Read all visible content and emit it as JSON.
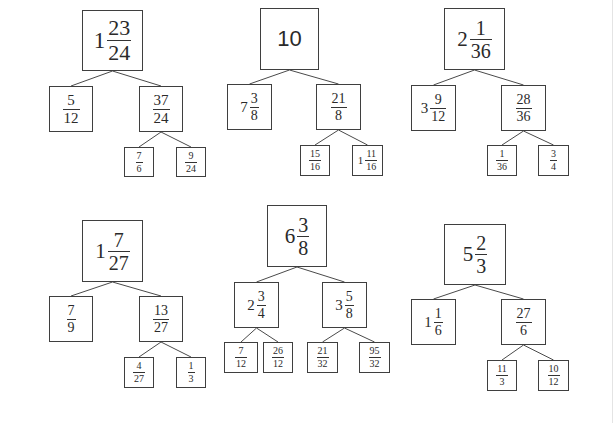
{
  "diagram": {
    "type": "fraction-decomposition-trees",
    "colors": {
      "background": "#ffffff",
      "border": "#3f3f3f",
      "text": "#2a2a2a",
      "edge": "#4a4a4a"
    },
    "trees": [
      {
        "id": "tree-1",
        "nodes": [
          {
            "id": "t1-root",
            "label": "1 23/24",
            "whole": "1",
            "num": "23",
            "den": "24",
            "box": [
              82,
              10,
              61,
              61
            ],
            "size": 22
          },
          {
            "id": "t1-left",
            "label": "5/12",
            "whole": "",
            "num": "5",
            "den": "12",
            "box": [
              49,
              86,
              44,
              46
            ],
            "size": 15
          },
          {
            "id": "t1-right",
            "label": "37/24",
            "whole": "",
            "num": "37",
            "den": "24",
            "box": [
              139,
              86,
              44,
              46
            ],
            "size": 15
          },
          {
            "id": "t1-rl",
            "label": "7/6",
            "whole": "",
            "num": "7",
            "den": "6",
            "box": [
              124,
              147,
              30,
              30
            ],
            "size": 10
          },
          {
            "id": "t1-rr",
            "label": "9/24",
            "whole": "",
            "num": "9",
            "den": "24",
            "box": [
              176,
              147,
              30,
              30
            ],
            "size": 10
          }
        ],
        "edges": [
          [
            "t1-root",
            "t1-left"
          ],
          [
            "t1-root",
            "t1-right"
          ],
          [
            "t1-right",
            "t1-rl"
          ],
          [
            "t1-right",
            "t1-rr"
          ]
        ]
      },
      {
        "id": "tree-2",
        "nodes": [
          {
            "id": "t2-root",
            "label": "10",
            "whole": "10",
            "num": "",
            "den": "",
            "box": [
              260,
              8,
              59,
              62
            ],
            "size": 22
          },
          {
            "id": "t2-left",
            "label": "7 3/8",
            "whole": "7",
            "num": "3",
            "den": "8",
            "box": [
              227,
              84,
              45,
              46
            ],
            "size": 14
          },
          {
            "id": "t2-right",
            "label": "21/8",
            "whole": "",
            "num": "21",
            "den": "8",
            "box": [
              316,
              84,
              45,
              46
            ],
            "size": 14
          },
          {
            "id": "t2-rl",
            "label": "15/16",
            "whole": "",
            "num": "15",
            "den": "16",
            "box": [
              300,
              145,
              30,
              31
            ],
            "size": 10
          },
          {
            "id": "t2-rr",
            "label": "1 11/16",
            "whole": "1",
            "num": "11",
            "den": "16",
            "box": [
              352,
              145,
              31,
              31
            ],
            "size": 10
          }
        ],
        "edges": [
          [
            "t2-root",
            "t2-left"
          ],
          [
            "t2-root",
            "t2-right"
          ],
          [
            "t2-right",
            "t2-rl"
          ],
          [
            "t2-right",
            "t2-rr"
          ]
        ]
      },
      {
        "id": "tree-3",
        "nodes": [
          {
            "id": "t3-root",
            "label": "2 1/36",
            "whole": "2",
            "num": "1",
            "den": "36",
            "box": [
              444,
              8,
              61,
              62
            ],
            "size": 20
          },
          {
            "id": "t3-left",
            "label": "3 9/12",
            "whole": "3",
            "num": "9",
            "den": "12",
            "box": [
              411,
              85,
              45,
              46
            ],
            "size": 14
          },
          {
            "id": "t3-right",
            "label": "28/36",
            "whole": "",
            "num": "28",
            "den": "36",
            "box": [
              501,
              85,
              45,
              46
            ],
            "size": 14
          },
          {
            "id": "t3-rl",
            "label": "1/36",
            "whole": "",
            "num": "1",
            "den": "36",
            "box": [
              487,
              145,
              30,
              31
            ],
            "size": 10
          },
          {
            "id": "t3-rr",
            "label": "3/4",
            "whole": "",
            "num": "3",
            "den": "4",
            "box": [
              538,
              145,
              31,
              31
            ],
            "size": 10
          }
        ],
        "edges": [
          [
            "t3-root",
            "t3-left"
          ],
          [
            "t3-root",
            "t3-right"
          ],
          [
            "t3-right",
            "t3-rl"
          ],
          [
            "t3-right",
            "t3-rr"
          ]
        ]
      },
      {
        "id": "tree-4",
        "nodes": [
          {
            "id": "t4-root",
            "label": "1 7/27",
            "whole": "1",
            "num": "7",
            "den": "27",
            "box": [
              82,
              220,
              61,
              62
            ],
            "size": 20
          },
          {
            "id": "t4-left",
            "label": "7/9",
            "whole": "",
            "num": "7",
            "den": "9",
            "box": [
              49,
              296,
              44,
              46
            ],
            "size": 14
          },
          {
            "id": "t4-right",
            "label": "13/27",
            "whole": "",
            "num": "13",
            "den": "27",
            "box": [
              139,
              296,
              44,
              46
            ],
            "size": 14
          },
          {
            "id": "t4-rl",
            "label": "4/27",
            "whole": "",
            "num": "4",
            "den": "27",
            "box": [
              124,
              357,
              30,
              31
            ],
            "size": 10
          },
          {
            "id": "t4-rr",
            "label": "1/3",
            "whole": "",
            "num": "1",
            "den": "3",
            "box": [
              176,
              357,
              30,
              31
            ],
            "size": 10
          }
        ],
        "edges": [
          [
            "t4-root",
            "t4-left"
          ],
          [
            "t4-root",
            "t4-right"
          ],
          [
            "t4-right",
            "t4-rl"
          ],
          [
            "t4-right",
            "t4-rr"
          ]
        ]
      },
      {
        "id": "tree-5",
        "nodes": [
          {
            "id": "t5-root",
            "label": "6 3/8",
            "whole": "6",
            "num": "3",
            "den": "8",
            "box": [
              267,
              205,
              60,
              62
            ],
            "size": 20
          },
          {
            "id": "t5-left",
            "label": "2 3/4",
            "whole": "2",
            "num": "3",
            "den": "4",
            "box": [
              234,
              282,
              45,
              46
            ],
            "size": 14
          },
          {
            "id": "t5-right",
            "label": "3 5/8",
            "whole": "3",
            "num": "5",
            "den": "8",
            "box": [
              322,
              282,
              45,
              46
            ],
            "size": 14
          },
          {
            "id": "t5-ll",
            "label": "7/12",
            "whole": "",
            "num": "7",
            "den": "12",
            "box": [
              224,
              342,
              34,
              31
            ],
            "size": 10
          },
          {
            "id": "t5-lr",
            "label": "26/12",
            "whole": "",
            "num": "26",
            "den": "12",
            "box": [
              263,
              342,
              30,
              31
            ],
            "size": 10
          },
          {
            "id": "t5-rl",
            "label": "21/32",
            "whole": "",
            "num": "21",
            "den": "32",
            "box": [
              307,
              342,
              31,
              31
            ],
            "size": 10
          },
          {
            "id": "t5-rr",
            "label": "95/32",
            "whole": "",
            "num": "95",
            "den": "32",
            "box": [
              359,
              342,
              31,
              31
            ],
            "size": 10
          }
        ],
        "edges": [
          [
            "t5-root",
            "t5-left"
          ],
          [
            "t5-root",
            "t5-right"
          ],
          [
            "t5-left",
            "t5-ll"
          ],
          [
            "t5-left",
            "t5-lr"
          ],
          [
            "t5-right",
            "t5-rl"
          ],
          [
            "t5-right",
            "t5-rr"
          ]
        ]
      },
      {
        "id": "tree-6",
        "nodes": [
          {
            "id": "t6-root",
            "label": "5 2/3",
            "whole": "5",
            "num": "2",
            "den": "3",
            "box": [
              444,
              224,
              62,
              61
            ],
            "size": 20
          },
          {
            "id": "t6-left",
            "label": "1 1/6",
            "whole": "1",
            "num": "1",
            "den": "6",
            "box": [
              411,
              299,
              45,
              46
            ],
            "size": 14
          },
          {
            "id": "t6-right",
            "label": "27/6",
            "whole": "",
            "num": "27",
            "den": "6",
            "box": [
              501,
              299,
              45,
              46
            ],
            "size": 14
          },
          {
            "id": "t6-rl",
            "label": "11/3",
            "whole": "",
            "num": "11",
            "den": "3",
            "box": [
              487,
              360,
              30,
              31
            ],
            "size": 10
          },
          {
            "id": "t6-rr",
            "label": "10/12",
            "whole": "",
            "num": "10",
            "den": "12",
            "box": [
              538,
              360,
              31,
              31
            ],
            "size": 10
          }
        ],
        "edges": [
          [
            "t6-root",
            "t6-left"
          ],
          [
            "t6-root",
            "t6-right"
          ],
          [
            "t6-right",
            "t6-rl"
          ],
          [
            "t6-right",
            "t6-rr"
          ]
        ]
      }
    ]
  }
}
